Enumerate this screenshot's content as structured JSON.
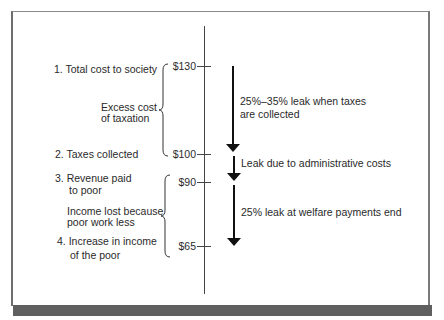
{
  "diagram": {
    "labels": {
      "total_cost": "1. Total cost to society",
      "excess_cost_line1": "Excess cost",
      "excess_cost_line2": "of taxation",
      "taxes_collected": "2. Taxes collected",
      "revenue_line1": "3. Revenue paid",
      "revenue_line2": "to poor",
      "income_lost_line1": "Income lost because",
      "income_lost_line2": "poor work less",
      "increase_line1": "4. Increase in income",
      "increase_line2": "of the poor"
    },
    "values": {
      "v130": "$130",
      "v100": "$100",
      "v90": "$90",
      "v65": "$65"
    },
    "leaks": {
      "leak1_line1": "25%–35% leak when taxes",
      "leak1_line2": "are collected",
      "leak2": "Leak due to administrative costs",
      "leak3": "25% leak at welfare payments end"
    },
    "colors": {
      "frame": "#6d6d6d",
      "bottom_bar": "#5f5f5f",
      "arrow": "#111111"
    }
  }
}
